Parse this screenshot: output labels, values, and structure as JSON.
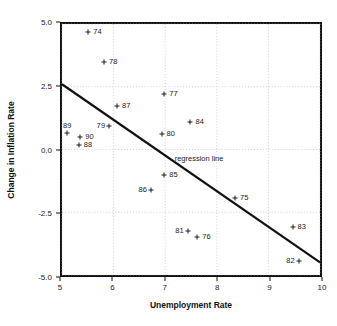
{
  "chart_data": {
    "type": "scatter",
    "title": "",
    "xlabel": "Unemployment Rate",
    "ylabel": "Change in Inflation Rate",
    "xlim": [
      5,
      10
    ],
    "ylim": [
      -5.0,
      5.0
    ],
    "xticks": [
      "5",
      "6",
      "7",
      "8",
      "9",
      "10"
    ],
    "xtick_values": [
      5,
      6,
      7,
      8,
      9,
      10
    ],
    "yticks": [
      "5.0",
      "2.5",
      "0.0",
      "-2.5",
      "-5.0"
    ],
    "ytick_values": [
      5.0,
      2.5,
      0.0,
      -2.5,
      -5.0
    ],
    "grid": true,
    "legend": "none",
    "point_labels_are": "two-digit year",
    "points": [
      {
        "label": "74",
        "x": 5.5,
        "y": 4.7,
        "label_pos": "right"
      },
      {
        "label": "78",
        "x": 5.8,
        "y": 3.5,
        "label_pos": "right"
      },
      {
        "label": "77",
        "x": 6.95,
        "y": 2.25,
        "label_pos": "right"
      },
      {
        "label": "87",
        "x": 6.05,
        "y": 1.8,
        "label_pos": "right"
      },
      {
        "label": "84",
        "x": 7.45,
        "y": 1.15,
        "label_pos": "right"
      },
      {
        "label": "79",
        "x": 5.9,
        "y": 1.0,
        "label_pos": "left"
      },
      {
        "label": "89",
        "x": 5.1,
        "y": 0.72,
        "label_pos": "above"
      },
      {
        "label": "80",
        "x": 6.9,
        "y": 0.7,
        "label_pos": "right"
      },
      {
        "label": "90",
        "x": 5.35,
        "y": 0.58,
        "label_pos": "right"
      },
      {
        "label": "88",
        "x": 5.32,
        "y": 0.25,
        "label_pos": "right"
      },
      {
        "label": "85",
        "x": 6.95,
        "y": -0.92,
        "label_pos": "right"
      },
      {
        "label": "86",
        "x": 6.7,
        "y": -1.5,
        "label_pos": "left"
      },
      {
        "label": "75",
        "x": 8.3,
        "y": -1.82,
        "label_pos": "right"
      },
      {
        "label": "83",
        "x": 9.4,
        "y": -2.95,
        "label_pos": "right"
      },
      {
        "label": "81",
        "x": 7.4,
        "y": -3.1,
        "label_pos": "left"
      },
      {
        "label": "76",
        "x": 7.58,
        "y": -3.35,
        "label_pos": "right"
      },
      {
        "label": "82",
        "x": 9.52,
        "y": -4.28,
        "label_pos": "left"
      }
    ],
    "regression_line": {
      "annotation": "regression line",
      "x_start": 5.0,
      "y_start": 2.6,
      "x_end": 10.0,
      "y_end": -4.5,
      "annotation_x": 7.15,
      "annotation_y": -0.3,
      "color": "#111111"
    },
    "colors": {
      "axis": "#111111",
      "grid": "#b9b9b9",
      "marker": "#1a1a1a",
      "background": "#ffffff"
    }
  }
}
